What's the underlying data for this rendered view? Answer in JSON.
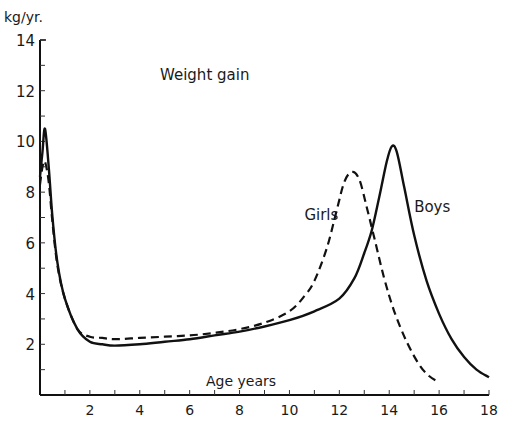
{
  "chart_data": {
    "type": "line",
    "title": "Weight gain",
    "xlabel": "Age years",
    "ylabel": "kg/yr.",
    "xlim": [
      0,
      18
    ],
    "ylim": [
      0,
      14
    ],
    "x_ticks": [
      2,
      4,
      6,
      8,
      10,
      12,
      14,
      16,
      18
    ],
    "y_ticks": [
      2,
      4,
      6,
      8,
      10,
      12,
      14
    ],
    "grid": false,
    "legend": "inline labels",
    "series": [
      {
        "name": "Boys",
        "style": "solid",
        "color": "#111111",
        "label_pos": [
          15.0,
          7.2
        ],
        "points": [
          [
            0.0,
            8.6
          ],
          [
            0.1,
            9.6
          ],
          [
            0.2,
            10.5
          ],
          [
            0.35,
            9.0
          ],
          [
            0.5,
            7.0
          ],
          [
            0.7,
            5.2
          ],
          [
            1.0,
            3.8
          ],
          [
            1.5,
            2.6
          ],
          [
            2.0,
            2.1
          ],
          [
            2.5,
            2.0
          ],
          [
            3.0,
            1.95
          ],
          [
            4.0,
            2.0
          ],
          [
            5.0,
            2.1
          ],
          [
            6.0,
            2.2
          ],
          [
            7.0,
            2.35
          ],
          [
            8.0,
            2.5
          ],
          [
            9.0,
            2.7
          ],
          [
            10.0,
            2.95
          ],
          [
            11.0,
            3.3
          ],
          [
            12.0,
            3.8
          ],
          [
            12.6,
            4.6
          ],
          [
            13.0,
            5.6
          ],
          [
            13.3,
            6.5
          ],
          [
            13.6,
            7.8
          ],
          [
            13.9,
            9.2
          ],
          [
            14.1,
            9.8
          ],
          [
            14.3,
            9.6
          ],
          [
            14.6,
            8.2
          ],
          [
            15.0,
            6.3
          ],
          [
            15.5,
            4.5
          ],
          [
            16.0,
            3.2
          ],
          [
            16.5,
            2.2
          ],
          [
            17.0,
            1.5
          ],
          [
            17.5,
            1.0
          ],
          [
            18.0,
            0.7
          ]
        ]
      },
      {
        "name": "Girls",
        "style": "dashed",
        "color": "#111111",
        "label_pos": [
          10.6,
          6.9
        ],
        "points": [
          [
            0.0,
            8.3
          ],
          [
            0.1,
            9.0
          ],
          [
            0.2,
            9.2
          ],
          [
            0.35,
            8.4
          ],
          [
            0.5,
            6.8
          ],
          [
            0.7,
            5.1
          ],
          [
            1.0,
            3.8
          ],
          [
            1.5,
            2.6
          ],
          [
            2.0,
            2.3
          ],
          [
            2.5,
            2.25
          ],
          [
            3.0,
            2.2
          ],
          [
            4.0,
            2.25
          ],
          [
            5.0,
            2.3
          ],
          [
            6.0,
            2.35
          ],
          [
            7.0,
            2.45
          ],
          [
            8.0,
            2.6
          ],
          [
            9.0,
            2.85
          ],
          [
            10.0,
            3.3
          ],
          [
            10.6,
            3.9
          ],
          [
            11.0,
            4.5
          ],
          [
            11.5,
            5.8
          ],
          [
            11.9,
            7.3
          ],
          [
            12.2,
            8.4
          ],
          [
            12.5,
            8.8
          ],
          [
            12.8,
            8.5
          ],
          [
            13.1,
            7.4
          ],
          [
            13.4,
            6.2
          ],
          [
            13.8,
            4.6
          ],
          [
            14.2,
            3.3
          ],
          [
            14.7,
            2.1
          ],
          [
            15.2,
            1.2
          ],
          [
            15.6,
            0.75
          ],
          [
            16.0,
            0.5
          ]
        ]
      }
    ],
    "annotations": [
      "Weight gain",
      "Girls",
      "Boys"
    ]
  }
}
